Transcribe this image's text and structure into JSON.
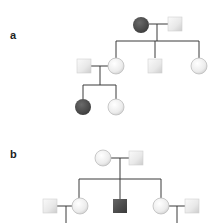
{
  "diagram": {
    "type": "pedigree",
    "colors": {
      "affected": "#4a4a4a",
      "unaffected_light": "#f7f7f7",
      "unaffected_dark": "#cfcfcf",
      "outline": "#bdbdbd",
      "line": "#3a3a3a"
    },
    "panels": [
      {
        "label": "a",
        "individuals": [
          {
            "id": "a-I-1",
            "sex": "female",
            "affected": true,
            "generation": "I"
          },
          {
            "id": "a-I-2",
            "sex": "male",
            "affected": false,
            "generation": "I"
          },
          {
            "id": "a-II-1",
            "sex": "male",
            "affected": false,
            "generation": "II",
            "note": "spouse"
          },
          {
            "id": "a-II-2",
            "sex": "female",
            "affected": false,
            "generation": "II"
          },
          {
            "id": "a-II-3",
            "sex": "male",
            "affected": false,
            "generation": "II"
          },
          {
            "id": "a-II-4",
            "sex": "female",
            "affected": false,
            "generation": "II"
          },
          {
            "id": "a-III-1",
            "sex": "female",
            "affected": true,
            "generation": "III"
          },
          {
            "id": "a-III-2",
            "sex": "female",
            "affected": false,
            "generation": "III"
          }
        ]
      },
      {
        "label": "b",
        "individuals": [
          {
            "id": "b-I-1",
            "sex": "female",
            "affected": false,
            "generation": "I"
          },
          {
            "id": "b-I-2",
            "sex": "male",
            "affected": false,
            "generation": "I"
          },
          {
            "id": "b-II-1",
            "sex": "male",
            "affected": false,
            "generation": "II",
            "note": "spouse"
          },
          {
            "id": "b-II-2",
            "sex": "female",
            "affected": false,
            "generation": "II"
          },
          {
            "id": "b-II-3",
            "sex": "male",
            "affected": true,
            "generation": "II"
          },
          {
            "id": "b-II-4",
            "sex": "female",
            "affected": false,
            "generation": "II"
          },
          {
            "id": "b-II-5",
            "sex": "male",
            "affected": false,
            "generation": "II",
            "note": "spouse"
          }
        ]
      }
    ]
  }
}
